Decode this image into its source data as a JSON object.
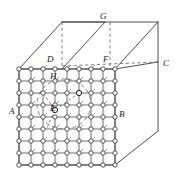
{
  "figure": {
    "name": "crystal-lattice-in-parallelepiped",
    "background_color": "#ffffff",
    "line_color": "#3a3a3a",
    "dashed_color": "#6a6a6a",
    "node_fill": "#ffffff",
    "node_stroke": "#2b2b2b"
  },
  "labels": [
    {
      "id": "A",
      "text": "A",
      "x": 9,
      "y": 107
    },
    {
      "id": "B",
      "text": "B",
      "x": 119,
      "y": 110
    },
    {
      "id": "C",
      "text": "C",
      "x": 163,
      "y": 59
    },
    {
      "id": "D",
      "text": "D",
      "x": 47,
      "y": 55
    },
    {
      "id": "E",
      "text": "E",
      "x": 50,
      "y": 104
    },
    {
      "id": "F",
      "text": "F",
      "x": 103,
      "y": 55
    },
    {
      "id": "G",
      "text": "G",
      "x": 100,
      "y": 12
    },
    {
      "id": "H",
      "text": "H",
      "x": 50,
      "y": 72
    }
  ],
  "geometry": {
    "cube": {
      "front_bottom_left": {
        "x": 19,
        "y": 165
      },
      "front_bottom_right": {
        "x": 115,
        "y": 165
      },
      "front_top_left": {
        "x": 19,
        "y": 69
      },
      "front_top_right": {
        "x": 115,
        "y": 69
      },
      "back_bottom_right": {
        "x": 158,
        "y": 131
      },
      "back_top_right": {
        "x": 158,
        "y": 62
      },
      "top_back_left": {
        "x": 62,
        "y": 22
      },
      "top_back_right": {
        "x": 158,
        "y": 22
      },
      "hidden_D": {
        "x": 57,
        "y": 66
      },
      "hidden_F": {
        "x": 110,
        "y": 66
      },
      "hidden_G": {
        "x": 105,
        "y": 22
      }
    },
    "lattice": {
      "origin": {
        "x": 19,
        "y": 69
      },
      "columns": 9,
      "rows": 9,
      "spacing_x": 12,
      "spacing_y": 12,
      "node_radius": 2.2
    },
    "highlight_circle": {
      "center": {
        "x": 64,
        "y": 104
      },
      "rx": 27,
      "ry": 25,
      "style": "dashed"
    },
    "defect_point": {
      "x": 55,
      "y": 110
    }
  }
}
